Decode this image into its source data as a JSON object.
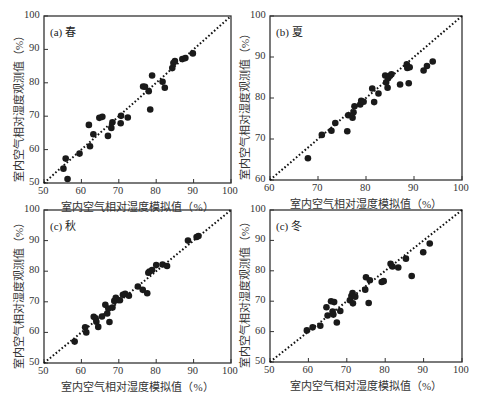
{
  "chart_data": [
    {
      "type": "scatter",
      "panel": "a",
      "title": "(a) 春",
      "xlabel": "室内空气相对湿度模拟值（%）",
      "ylabel": "室内空气相对湿度观测值（%）",
      "xlim": [
        50,
        100
      ],
      "ylim": [
        50,
        100
      ],
      "xticks": [
        50,
        60,
        70,
        80,
        90,
        100
      ],
      "yticks": [
        50,
        60,
        70,
        80,
        90,
        100
      ],
      "reference_line": "1:1 dotted",
      "points": [
        [
          55.2,
          54.3
        ],
        [
          55.8,
          57.3
        ],
        [
          56.3,
          51.2
        ],
        [
          59.5,
          58.8
        ],
        [
          62.0,
          67.4
        ],
        [
          62.3,
          61.0
        ],
        [
          63.2,
          64.6
        ],
        [
          64.8,
          69.5
        ],
        [
          65.6,
          69.8
        ],
        [
          67.1,
          64.1
        ],
        [
          68.0,
          66.5
        ],
        [
          68.3,
          68.2
        ],
        [
          70.5,
          67.9
        ],
        [
          70.6,
          70.1
        ],
        [
          72.4,
          69.6
        ],
        [
          76.5,
          78.9
        ],
        [
          77.0,
          78.8
        ],
        [
          78.0,
          77.5
        ],
        [
          78.4,
          72.0
        ],
        [
          78.9,
          82.2
        ],
        [
          81.7,
          80.3
        ],
        [
          82.3,
          78.5
        ],
        [
          84.3,
          84.4
        ],
        [
          84.6,
          85.9
        ],
        [
          85.0,
          86.5
        ],
        [
          87.0,
          87.1
        ],
        [
          87.8,
          87.4
        ],
        [
          89.8,
          88.8
        ]
      ]
    },
    {
      "type": "scatter",
      "panel": "b",
      "title": "(b) 夏",
      "xlabel": "室内空气相对湿度模拟值（%）",
      "ylabel": "室内空气相对湿度观测值（%）",
      "xlim": [
        60,
        100
      ],
      "ylim": [
        60,
        100
      ],
      "xticks": [
        60,
        70,
        80,
        90,
        100
      ],
      "yticks": [
        60,
        70,
        80,
        90,
        100
      ],
      "reference_line": "1:1 dotted",
      "points": [
        [
          67.9,
          65.3
        ],
        [
          70.8,
          71.0
        ],
        [
          72.8,
          72.0
        ],
        [
          73.6,
          73.9
        ],
        [
          76.1,
          71.9
        ],
        [
          76.3,
          75.8
        ],
        [
          77.2,
          75.2
        ],
        [
          77.4,
          76.5
        ],
        [
          77.6,
          78.0
        ],
        [
          78.8,
          78.4
        ],
        [
          79.0,
          79.3
        ],
        [
          79.5,
          79.1
        ],
        [
          81.3,
          82.3
        ],
        [
          81.7,
          79.0
        ],
        [
          82.6,
          81.1
        ],
        [
          84.0,
          85.5
        ],
        [
          84.2,
          83.8
        ],
        [
          84.5,
          82.5
        ],
        [
          84.6,
          84.8
        ],
        [
          85.0,
          85.4
        ],
        [
          85.3,
          85.8
        ],
        [
          87.1,
          83.3
        ],
        [
          88.5,
          88.2
        ],
        [
          88.6,
          87.3
        ],
        [
          88.9,
          83.6
        ],
        [
          89.1,
          87.5
        ],
        [
          92.0,
          86.7
        ],
        [
          92.7,
          87.8
        ],
        [
          93.9,
          88.9
        ]
      ]
    },
    {
      "type": "scatter",
      "panel": "c",
      "title": "(c) 秋",
      "xlabel": "室内空气相对湿度模拟值（%）",
      "ylabel": "室内空气相对湿度观测值（%）",
      "xlim": [
        50,
        100
      ],
      "ylim": [
        50,
        100
      ],
      "xticks": [
        50,
        60,
        70,
        80,
        90,
        100
      ],
      "yticks": [
        50,
        60,
        70,
        80,
        90,
        100
      ],
      "reference_line": "1:1 dotted",
      "points": [
        [
          58.2,
          57.0
        ],
        [
          61.0,
          61.7
        ],
        [
          61.3,
          60.0
        ],
        [
          63.3,
          65.1
        ],
        [
          63.8,
          64.6
        ],
        [
          64.0,
          63.5
        ],
        [
          64.5,
          61.8
        ],
        [
          65.5,
          65.2
        ],
        [
          66.4,
          69.0
        ],
        [
          66.9,
          66.2
        ],
        [
          67.2,
          67.8
        ],
        [
          67.5,
          63.4
        ],
        [
          68.3,
          68.1
        ],
        [
          68.8,
          70.3
        ],
        [
          69.2,
          71.3
        ],
        [
          69.6,
          70.6
        ],
        [
          70.3,
          70.5
        ],
        [
          71.1,
          72.3
        ],
        [
          71.7,
          72.6
        ],
        [
          72.7,
          72.0
        ],
        [
          75.1,
          75.0
        ],
        [
          76.4,
          73.9
        ],
        [
          77.6,
          72.8
        ],
        [
          77.9,
          79.5
        ],
        [
          78.2,
          79.9
        ],
        [
          78.9,
          80.4
        ],
        [
          80.0,
          82.0
        ],
        [
          81.7,
          82.2
        ],
        [
          82.9,
          81.7
        ],
        [
          88.5,
          90.0
        ],
        [
          90.8,
          91.2
        ],
        [
          91.3,
          91.5
        ]
      ]
    },
    {
      "type": "scatter",
      "panel": "d",
      "title": "(c) 冬",
      "xlabel": "室内空气相对湿度模拟值（%）",
      "ylabel": "室内空气相对湿度观测值（%）",
      "xlim": [
        50,
        100
      ],
      "ylim": [
        50,
        100
      ],
      "xticks": [
        50,
        60,
        70,
        80,
        90,
        100
      ],
      "yticks": [
        50,
        60,
        70,
        80,
        90,
        100
      ],
      "reference_line": "1:1 dotted",
      "points": [
        [
          59.6,
          60.4
        ],
        [
          61.1,
          61.4
        ],
        [
          63.1,
          61.9
        ],
        [
          64.7,
          68.0
        ],
        [
          65.0,
          65.3
        ],
        [
          65.9,
          70.0
        ],
        [
          66.3,
          66.6
        ],
        [
          66.5,
          65.6
        ],
        [
          66.7,
          69.7
        ],
        [
          67.4,
          63.0
        ],
        [
          68.3,
          66.8
        ],
        [
          70.8,
          70.3
        ],
        [
          71.2,
          71.7
        ],
        [
          71.5,
          72.7
        ],
        [
          71.6,
          69.3
        ],
        [
          72.2,
          71.5
        ],
        [
          74.8,
          73.8
        ],
        [
          75.0,
          77.9
        ],
        [
          75.7,
          69.4
        ],
        [
          76.0,
          76.9
        ],
        [
          79.1,
          76.3
        ],
        [
          79.6,
          76.6
        ],
        [
          81.4,
          82.3
        ],
        [
          81.9,
          81.4
        ],
        [
          83.4,
          81.1
        ],
        [
          85.4,
          84.0
        ],
        [
          86.9,
          78.3
        ],
        [
          89.9,
          86.1
        ],
        [
          91.6,
          89.0
        ]
      ]
    }
  ],
  "panels": {
    "a": {
      "title": "(a) 春"
    },
    "b": {
      "title": "(b) 夏"
    },
    "c": {
      "title": "(c) 秋"
    },
    "d": {
      "title": "(c) 冬"
    }
  },
  "labels": {
    "x_axis": "室内空气相对湿度模拟值（%）",
    "y_axis": "室内空气相对湿度观测值（%）"
  },
  "colors": {
    "point": "#1a1a1a",
    "frame": "#333333",
    "ref_line": "#111111"
  }
}
